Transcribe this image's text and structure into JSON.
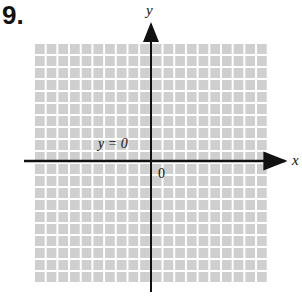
{
  "problem_number": "9.",
  "graph": {
    "x_axis_label": "x",
    "y_axis_label": "y",
    "origin_label": "0",
    "line_label": "y = 0",
    "grid": {
      "columns": 20,
      "rows": 20,
      "cell_color": "#cfcfcf",
      "line_color": "#ffffff"
    },
    "axis_color": "#111111"
  }
}
